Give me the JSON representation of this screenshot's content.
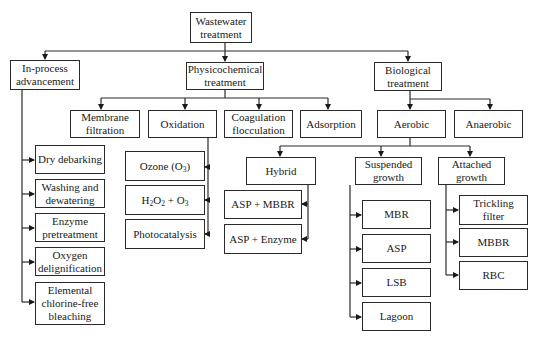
{
  "diagram": {
    "nodes": {
      "root": {
        "l1": "Wastewater",
        "l2": "treatment"
      },
      "inprocess": {
        "l1": "In-process",
        "l2": "advancement"
      },
      "physchem": {
        "l1": "Physicochemical",
        "l2": "treatment"
      },
      "bio": {
        "l1": "Biological",
        "l2": "treatment"
      },
      "membrane": {
        "l1": "Membrane",
        "l2": "filtration"
      },
      "oxidation": {
        "l1": "Oxidation"
      },
      "coag": {
        "l1": "Coagulation",
        "l2": "flocculation"
      },
      "adsorption": {
        "l1": "Adsorption"
      },
      "aerobic": {
        "l1": "Aerobic"
      },
      "anaerobic": {
        "l1": "Anaerobic"
      },
      "drydebark": {
        "l1": "Dry debarking"
      },
      "washing": {
        "l1": "Washing and",
        "l2": "dewatering"
      },
      "enzyme": {
        "l1": "Enzyme",
        "l2": "pretreatment"
      },
      "oxygen": {
        "l1": "Oxygen",
        "l2": "delignification"
      },
      "ecf": {
        "l1": "Elemental",
        "l2": "chlorine-free",
        "l3": "bleaching"
      },
      "ozone": {
        "pre": "Ozone (O",
        "sub": "3",
        "post": ")"
      },
      "h2o2": {
        "a": "H",
        "s1": "2",
        "b": "O",
        "s2": "2",
        "c": " + O",
        "s3": "3"
      },
      "photocat": {
        "l1": "Photocatalysis"
      },
      "hybrid": {
        "l1": "Hybrid"
      },
      "aspmbbr": {
        "l1": "ASP + MBBR"
      },
      "aspenzyme": {
        "l1": "ASP + Enzyme"
      },
      "suspended": {
        "l1": "Suspended",
        "l2": "growth"
      },
      "attached": {
        "l1": "Attached",
        "l2": "growth"
      },
      "mbr": {
        "l1": "MBR"
      },
      "asp": {
        "l1": "ASP"
      },
      "lsb": {
        "l1": "LSB"
      },
      "lagoon": {
        "l1": "Lagoon"
      },
      "trickling": {
        "l1": "Trickling",
        "l2": "filter"
      },
      "mbbr": {
        "l1": "MBBR"
      },
      "rbc": {
        "l1": "RBC"
      }
    },
    "edges": [
      [
        "root",
        "inprocess"
      ],
      [
        "root",
        "physchem"
      ],
      [
        "root",
        "bio"
      ],
      [
        "physchem",
        "membrane"
      ],
      [
        "physchem",
        "oxidation"
      ],
      [
        "physchem",
        "coag"
      ],
      [
        "physchem",
        "adsorption"
      ],
      [
        "bio",
        "aerobic"
      ],
      [
        "bio",
        "anaerobic"
      ],
      [
        "inprocess",
        "drydebark"
      ],
      [
        "inprocess",
        "washing"
      ],
      [
        "inprocess",
        "enzyme"
      ],
      [
        "inprocess",
        "oxygen"
      ],
      [
        "inprocess",
        "ecf"
      ],
      [
        "oxidation",
        "ozone"
      ],
      [
        "oxidation",
        "h2o2"
      ],
      [
        "oxidation",
        "photocat"
      ],
      [
        "aerobic",
        "hybrid"
      ],
      [
        "aerobic",
        "suspended"
      ],
      [
        "aerobic",
        "attached"
      ],
      [
        "hybrid",
        "aspmbbr"
      ],
      [
        "hybrid",
        "aspenzyme"
      ],
      [
        "suspended",
        "mbr"
      ],
      [
        "suspended",
        "asp"
      ],
      [
        "suspended",
        "lsb"
      ],
      [
        "suspended",
        "lagoon"
      ],
      [
        "attached",
        "trickling"
      ],
      [
        "attached",
        "mbbr"
      ],
      [
        "attached",
        "rbc"
      ]
    ],
    "colors": {
      "line": "#2a2a2a",
      "background": "#ffffff"
    }
  }
}
